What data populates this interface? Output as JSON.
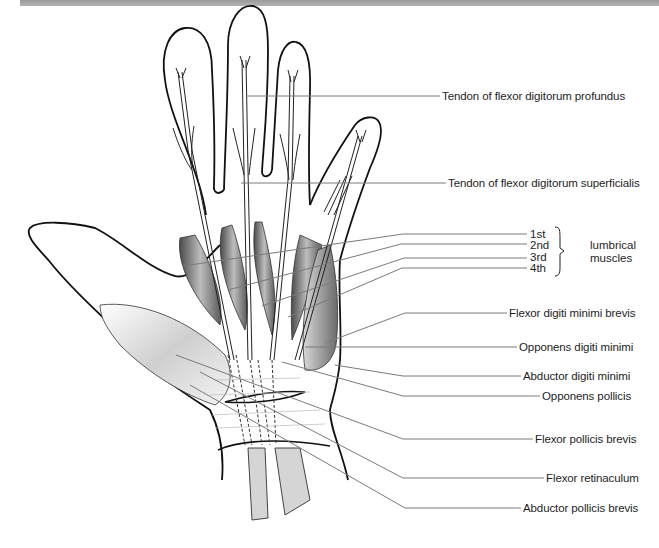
{
  "figure": {
    "colors": {
      "outline": "#111111",
      "leader": "#7a7a7a",
      "text": "#1e1e1e",
      "topbar": "#a8a8a8"
    }
  },
  "labels": {
    "tendon_fdp": "Tendon of flexor digitorum profundus",
    "tendon_fds": "Tendon of flexor digitorum superficialis",
    "lumbricals": {
      "items": [
        "1st",
        "2nd",
        "3rd",
        "4th"
      ],
      "group_line1": "lumbrical",
      "group_line2": "muscles"
    },
    "flexor_digiti_minimi_brevis": "Flexor digiti minimi brevis",
    "opponens_digiti_minimi": "Opponens digiti minimi",
    "abductor_digiti_minimi": "Abductor digiti minimi",
    "opponens_pollicis": "Opponens pollicis",
    "flexor_pollicis_brevis": "Flexor pollicis brevis",
    "flexor_retinaculum": "Flexor retinaculum",
    "abductor_pollicis_brevis": "Abductor pollicis brevis"
  }
}
